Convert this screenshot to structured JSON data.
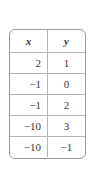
{
  "table": {
    "headers": [
      "x",
      "y"
    ],
    "rows": [
      [
        "2",
        "1"
      ],
      [
        "−1",
        "0"
      ],
      [
        "−1",
        "2"
      ],
      [
        "−10",
        "3"
      ],
      [
        "−10",
        "−1"
      ]
    ]
  }
}
